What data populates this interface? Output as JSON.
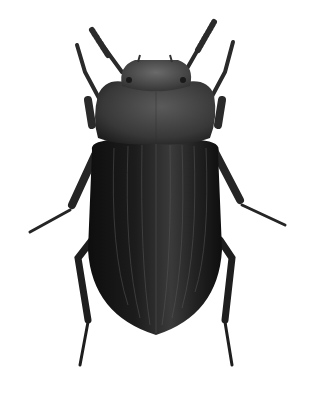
{
  "image": {
    "subject": "beetle",
    "style": "monochrome scientific illustration, dorsal view",
    "background": "#ffffff"
  },
  "top_strip": {
    "text": "",
    "note_visible": "cropped line of text, only lower edge visible, illegible"
  },
  "colors": {
    "elytra": "#151515",
    "pronotum": "#3a3a3a",
    "head": "#4a4a4a",
    "legs": "#2a2a2a",
    "highlight": "#6a6a6a"
  }
}
